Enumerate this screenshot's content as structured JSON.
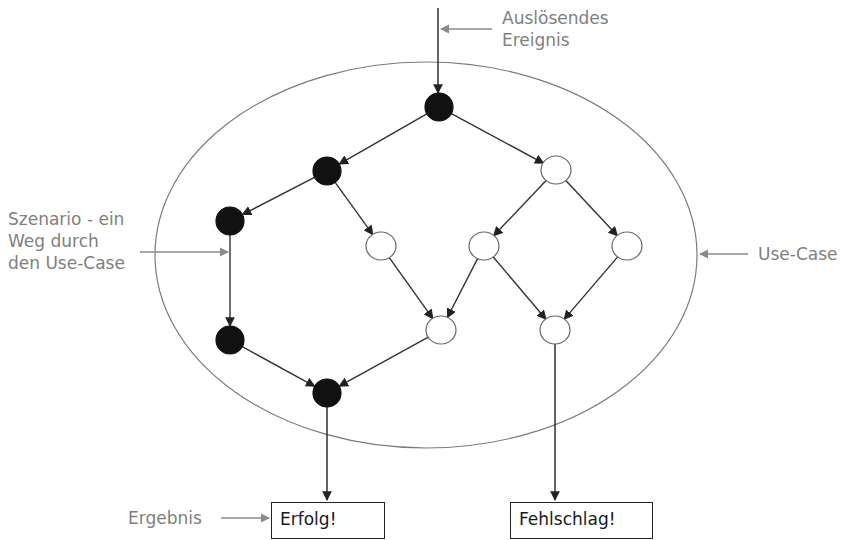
{
  "labels": {
    "trigger_line1": "Auslösendes",
    "trigger_line2": "Ereignis",
    "scenario_line1": "Szenario - ein",
    "scenario_line2": "Weg durch",
    "scenario_line3": "den Use-Case",
    "usecase": "Use-Case",
    "result": "Ergebnis"
  },
  "outcomes": {
    "success": "Erfolg!",
    "failure": "Fehlschlag!"
  },
  "colors": {
    "node_filled": "#111111",
    "node_empty": "#ffffff",
    "edge": "#333333",
    "annotation": "#808080",
    "ellipse": "#7a7a7a"
  },
  "nodes": [
    {
      "id": "n0",
      "x": 439,
      "y": 107,
      "filled": true
    },
    {
      "id": "n1",
      "x": 327,
      "y": 171,
      "filled": true
    },
    {
      "id": "n2",
      "x": 556,
      "y": 170,
      "filled": false
    },
    {
      "id": "n3",
      "x": 230,
      "y": 221,
      "filled": true
    },
    {
      "id": "n4",
      "x": 381,
      "y": 246,
      "filled": false
    },
    {
      "id": "n5",
      "x": 484,
      "y": 246,
      "filled": false
    },
    {
      "id": "n6",
      "x": 627,
      "y": 246,
      "filled": false
    },
    {
      "id": "n7",
      "x": 230,
      "y": 340,
      "filled": true
    },
    {
      "id": "n8",
      "x": 441,
      "y": 330,
      "filled": false
    },
    {
      "id": "n9",
      "x": 555,
      "y": 330,
      "filled": false
    },
    {
      "id": "n10",
      "x": 327,
      "y": 393,
      "filled": true
    }
  ],
  "edges": [
    [
      "n0",
      "n1"
    ],
    [
      "n0",
      "n2"
    ],
    [
      "n1",
      "n3"
    ],
    [
      "n1",
      "n4"
    ],
    [
      "n2",
      "n5"
    ],
    [
      "n2",
      "n6"
    ],
    [
      "n3",
      "n7"
    ],
    [
      "n4",
      "n8"
    ],
    [
      "n5",
      "n8"
    ],
    [
      "n5",
      "n9"
    ],
    [
      "n6",
      "n9"
    ],
    [
      "n7",
      "n10"
    ],
    [
      "n8",
      "n10"
    ]
  ]
}
